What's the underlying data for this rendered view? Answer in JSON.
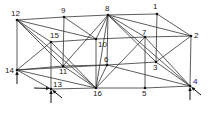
{
  "diagram": {
    "type": "space-truss",
    "nodes": [
      {
        "id": "1",
        "x": 157,
        "y": 14,
        "lx": 153,
        "ly": 3
      },
      {
        "id": "2",
        "x": 191,
        "y": 36,
        "lx": 194,
        "ly": 32
      },
      {
        "id": "3",
        "x": 156,
        "y": 62,
        "lx": 153,
        "ly": 64
      },
      {
        "id": "4",
        "x": 190,
        "y": 86,
        "lx": 193,
        "ly": 78
      },
      {
        "id": "5",
        "x": 145,
        "y": 88,
        "lx": 142,
        "ly": 90
      },
      {
        "id": "6",
        "x": 107,
        "y": 65,
        "lx": 104,
        "ly": 56
      },
      {
        "id": "7",
        "x": 145,
        "y": 37,
        "lx": 142,
        "ly": 29
      },
      {
        "id": "8",
        "x": 108,
        "y": 15,
        "lx": 105,
        "ly": 5
      },
      {
        "id": "9",
        "x": 64,
        "y": 17,
        "lx": 61,
        "ly": 7
      },
      {
        "id": "10",
        "x": 96,
        "y": 39,
        "lx": 98,
        "ly": 41
      },
      {
        "id": "11",
        "x": 63,
        "y": 66,
        "lx": 59,
        "ly": 68
      },
      {
        "id": "12",
        "x": 17,
        "y": 20,
        "lx": 11,
        "ly": 10
      },
      {
        "id": "13",
        "x": 51,
        "y": 89,
        "lx": 53,
        "ly": 81
      },
      {
        "id": "14",
        "x": 17,
        "y": 70,
        "lx": 5,
        "ly": 67
      },
      {
        "id": "15",
        "x": 51,
        "y": 42,
        "lx": 50,
        "ly": 32
      },
      {
        "id": "16",
        "x": 96,
        "y": 88,
        "lx": 93,
        "ly": 90
      }
    ],
    "edges": [
      [
        "12",
        "9"
      ],
      [
        "9",
        "8"
      ],
      [
        "8",
        "1"
      ],
      [
        "1",
        "2"
      ],
      [
        "2",
        "4"
      ],
      [
        "4",
        "5"
      ],
      [
        "5",
        "16"
      ],
      [
        "16",
        "13"
      ],
      [
        "13",
        "14"
      ],
      [
        "14",
        "12"
      ],
      [
        "12",
        "15"
      ],
      [
        "12",
        "10"
      ],
      [
        "12",
        "11"
      ],
      [
        "12",
        "16"
      ],
      [
        "9",
        "11"
      ],
      [
        "9",
        "10"
      ],
      [
        "8",
        "10"
      ],
      [
        "8",
        "6"
      ],
      [
        "8",
        "7"
      ],
      [
        "8",
        "2"
      ],
      [
        "8",
        "3"
      ],
      [
        "8",
        "4"
      ],
      [
        "8",
        "11"
      ],
      [
        "8",
        "16"
      ],
      [
        "1",
        "3"
      ],
      [
        "2",
        "7"
      ],
      [
        "2",
        "3"
      ],
      [
        "15",
        "10"
      ],
      [
        "15",
        "13"
      ],
      [
        "15",
        "16"
      ],
      [
        "15",
        "14"
      ],
      [
        "10",
        "16"
      ],
      [
        "10",
        "7"
      ],
      [
        "14",
        "11"
      ],
      [
        "14",
        "6"
      ],
      [
        "14",
        "16"
      ],
      [
        "11",
        "6"
      ],
      [
        "11",
        "16"
      ],
      [
        "6",
        "3"
      ],
      [
        "6",
        "4"
      ],
      [
        "6",
        "16"
      ],
      [
        "7",
        "5"
      ],
      [
        "7",
        "4"
      ],
      [
        "7",
        "16"
      ],
      [
        "3",
        "4"
      ]
    ],
    "supports": [
      {
        "node": "14",
        "arrows": [
          {
            "dir": "up"
          }
        ]
      },
      {
        "node": "13",
        "arrows": [
          {
            "dir": "right"
          },
          {
            "dir": "up"
          },
          {
            "dir": "diag"
          }
        ]
      },
      {
        "node": "4",
        "arrows": [
          {
            "dir": "up"
          },
          {
            "dir": "diag"
          }
        ]
      }
    ],
    "line_color": "#333333"
  }
}
